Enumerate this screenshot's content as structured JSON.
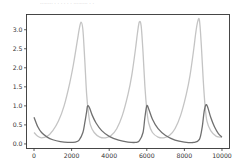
{
  "chart_data": {
    "type": "line",
    "title": "",
    "xlabel": "",
    "ylabel": "",
    "xlim": [
      -400,
      10400
    ],
    "ylim": [
      -0.12,
      3.4
    ],
    "grid": false,
    "legend": null,
    "xticks": [
      0,
      2000,
      4000,
      6000,
      8000,
      10000
    ],
    "xtick_labels": [
      "0",
      "2000",
      "4000",
      "6000",
      "8000",
      "10000"
    ],
    "yticks": [
      0.0,
      0.5,
      1.0,
      1.5,
      2.0,
      2.5,
      3.0
    ],
    "ytick_labels": [
      "0.0",
      "0.5",
      "1.0",
      "1.5",
      "2.0",
      "2.5",
      "3.0"
    ],
    "series": [
      {
        "name": "series-light",
        "color": "#c4c4c4",
        "x": [
          0,
          200,
          400,
          700,
          1000,
          1300,
          1600,
          1900,
          2100,
          2300,
          2400,
          2500,
          2600,
          2700,
          2800,
          2900,
          3000,
          3200,
          3500,
          3800,
          4100,
          4400,
          4700,
          5000,
          5200,
          5400,
          5500,
          5600,
          5700,
          5800,
          5900,
          6000,
          6100,
          6300,
          6600,
          6900,
          7200,
          7500,
          7800,
          8100,
          8300,
          8500,
          8600,
          8700,
          8800,
          8900,
          9000,
          9100,
          9200,
          9400,
          9700,
          10000
        ],
        "y": [
          0.3,
          0.2,
          0.16,
          0.2,
          0.35,
          0.6,
          1.0,
          1.6,
          2.1,
          2.7,
          3.0,
          3.2,
          3.0,
          2.2,
          1.3,
          0.8,
          0.5,
          0.3,
          0.18,
          0.16,
          0.22,
          0.4,
          0.75,
          1.3,
          1.8,
          2.5,
          2.9,
          3.2,
          3.1,
          2.4,
          1.5,
          0.9,
          0.55,
          0.3,
          0.18,
          0.16,
          0.22,
          0.4,
          0.75,
          1.3,
          1.8,
          2.5,
          2.9,
          3.2,
          3.25,
          2.6,
          1.7,
          1.0,
          0.6,
          0.35,
          0.2,
          0.18
        ],
        "peaks": [
          3.2,
          3.2,
          3.25
        ]
      },
      {
        "name": "series-dark",
        "color": "#707070",
        "x": [
          0,
          200,
          400,
          700,
          1000,
          1400,
          1800,
          2200,
          2400,
          2600,
          2700,
          2800,
          2850,
          2950,
          3100,
          3300,
          3600,
          4000,
          4500,
          5000,
          5400,
          5600,
          5800,
          5900,
          6000,
          6100,
          6300,
          6600,
          7000,
          7500,
          8000,
          8500,
          8800,
          8950,
          9050,
          9150,
          9250,
          9400,
          9600,
          9800,
          10000
        ],
        "y": [
          0.7,
          0.45,
          0.3,
          0.18,
          0.11,
          0.06,
          0.04,
          0.05,
          0.1,
          0.3,
          0.55,
          0.85,
          1.0,
          0.95,
          0.75,
          0.55,
          0.35,
          0.2,
          0.1,
          0.05,
          0.04,
          0.08,
          0.3,
          0.7,
          1.0,
          0.92,
          0.65,
          0.4,
          0.22,
          0.1,
          0.05,
          0.04,
          0.12,
          0.45,
          0.85,
          1.03,
          0.95,
          0.7,
          0.45,
          0.28,
          0.18
        ],
        "peaks": [
          1.0,
          1.0,
          1.03
        ]
      }
    ]
  },
  "header": {
    "truncated_text": "........ . . . . . . ......... . ."
  }
}
